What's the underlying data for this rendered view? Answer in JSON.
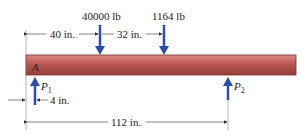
{
  "beam": {
    "label_A": "A",
    "color_top": "#c9706a",
    "color_mid": "#b4504c",
    "color_bottom": "#8e3a36"
  },
  "loads": [
    {
      "label": "40000 lb",
      "direction": "down"
    },
    {
      "label": "1164 lb",
      "direction": "down"
    }
  ],
  "reactions": [
    {
      "label": "P",
      "sub": "1",
      "direction": "up"
    },
    {
      "label": "P",
      "sub": "2",
      "direction": "up"
    }
  ],
  "dimensions": {
    "d1": "40 in.",
    "d2": "32 in.",
    "d3": "4 in.",
    "d4": "112 in."
  },
  "colors": {
    "arrow": "#2a4fa8",
    "dim": "#333333"
  }
}
